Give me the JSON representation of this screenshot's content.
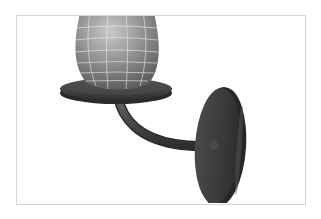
{
  "figure": {
    "caption": "3D rendered wall sconce lamp model",
    "parts": [
      "globe-shade",
      "saucer-base",
      "curved-arm",
      "oval-wall-plate"
    ],
    "colors": {
      "background": "#ffffff",
      "frame_border": "#d6d6d6",
      "globe_light": "#b5b5b5",
      "globe_dark": "#6a6a6a",
      "wireframe": "#e8e8e8",
      "metal_dark": "#3e3e3e",
      "metal_mid": "#555555"
    }
  }
}
